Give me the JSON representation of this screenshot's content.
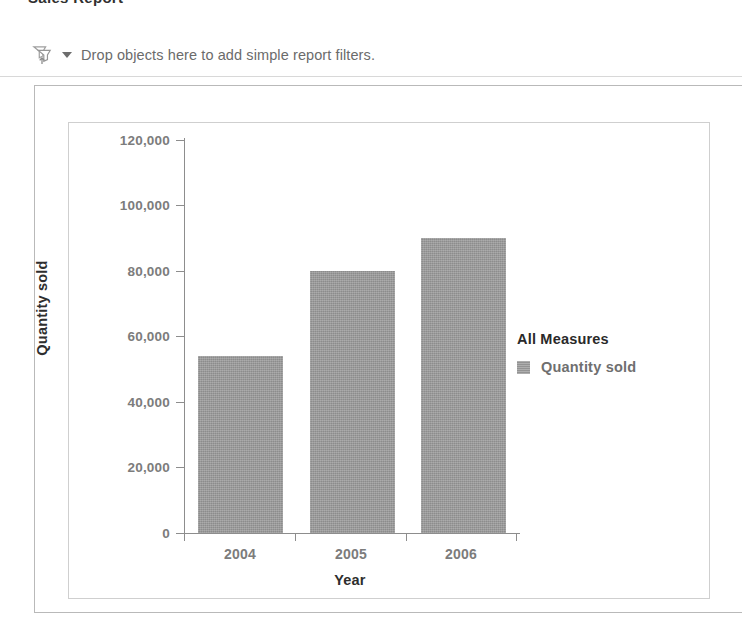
{
  "top_cut_text": "Sales Report",
  "filter_bar": {
    "icon": "drop-objects-filter-icon",
    "caret": "chevron-down-icon",
    "text": "Drop objects here to add simple report filters."
  },
  "legend": {
    "title": "All Measures",
    "entries": [
      {
        "label": "Quantity sold",
        "color": "#9c9c9c"
      }
    ]
  },
  "chart_data": {
    "type": "bar",
    "title": "",
    "categories": [
      "2004",
      "2005",
      "2006"
    ],
    "series": [
      {
        "name": "Quantity sold",
        "values": [
          54000,
          80000,
          90000
        ]
      }
    ],
    "values": [
      54000,
      80000,
      90000
    ],
    "xlabel": "Year",
    "ylabel": "Quantity sold",
    "ylim": [
      0,
      120000
    ],
    "ytick_labels": [
      "0",
      "20,000",
      "40,000",
      "60,000",
      "80,000",
      "100,000",
      "120,000"
    ],
    "ytick_values": [
      0,
      20000,
      40000,
      60000,
      80000,
      100000,
      120000
    ],
    "xtick_labels": [
      "2004",
      "2005",
      "2006"
    ],
    "grid": false,
    "legend_position": "right",
    "bar_color": "#9a9a9a"
  }
}
